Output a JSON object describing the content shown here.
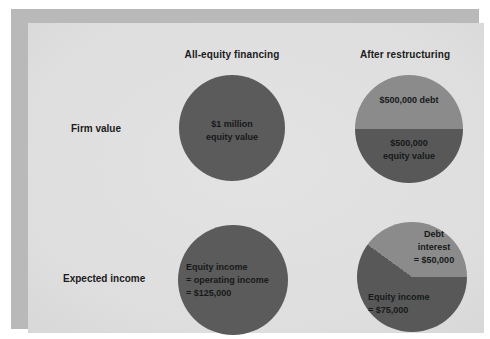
{
  "figure": {
    "columns": [
      {
        "id": "all-equity",
        "label": "All-equity financing"
      },
      {
        "id": "after-restructuring",
        "label": "After restructuring"
      }
    ],
    "rows": [
      {
        "id": "firm-value",
        "label": "Firm value"
      },
      {
        "id": "expected-income",
        "label": "Expected income"
      }
    ],
    "colors": {
      "background": "#dedede",
      "frame": "#b9b9b9",
      "equity_dark": "#5b5b5b",
      "debt_light": "#8b8b8b",
      "text": "#1b1b1b"
    }
  },
  "chart_data": [
    {
      "id": "all-equity-firm-value",
      "type": "pie",
      "row": "Firm value",
      "column": "All-equity financing",
      "title": "",
      "labels": [
        "$1 million\nequity value"
      ],
      "categories": [
        "Equity value"
      ],
      "values": [
        1000000
      ],
      "slice_percents": [
        100
      ],
      "slice_colors": [
        "#5b5b5b"
      ],
      "legend": "none"
    },
    {
      "id": "restructured-firm-value",
      "type": "pie",
      "row": "Firm value",
      "column": "After restructuring",
      "title": "",
      "labels": [
        "$500,000 debt",
        "$500,000\nequity value"
      ],
      "categories": [
        "Debt",
        "Equity value"
      ],
      "values": [
        500000,
        500000
      ],
      "slice_percents": [
        50,
        50
      ],
      "slice_colors": [
        "#8b8b8b",
        "#585858"
      ],
      "start_angle_deg": 270,
      "legend": "none"
    },
    {
      "id": "all-equity-expected-income",
      "type": "pie",
      "row": "Expected income",
      "column": "All-equity financing",
      "title": "",
      "labels": [
        "Equity income\n= operating income\n= $125,000"
      ],
      "categories": [
        "Equity income"
      ],
      "values": [
        125000
      ],
      "slice_percents": [
        100
      ],
      "slice_colors": [
        "#5b5b5b"
      ],
      "legend": "none"
    },
    {
      "id": "restructured-expected-income",
      "type": "pie",
      "row": "Expected income",
      "column": "After restructuring",
      "title": "",
      "labels": [
        "Debt\ninterest\n= $50,000",
        "Equity income\n= $75,000"
      ],
      "categories": [
        "Debt interest",
        "Equity income"
      ],
      "values": [
        50000,
        75000
      ],
      "slice_percents": [
        40,
        60
      ],
      "slice_colors": [
        "#8b8b8b",
        "#585858"
      ],
      "start_angle_deg": 90,
      "legend": "none"
    }
  ],
  "labels": {
    "all_equity_firm_value": "$1 million\nequity value",
    "restructured_debt": "$500,000 debt",
    "restructured_equity_value": "$500,000\nequity value",
    "all_equity_income": "Equity income\n= operating income\n= $125,000",
    "restructured_debt_interest": "Debt\ninterest\n= $50,000",
    "restructured_equity_income": "Equity income\n= $75,000"
  }
}
